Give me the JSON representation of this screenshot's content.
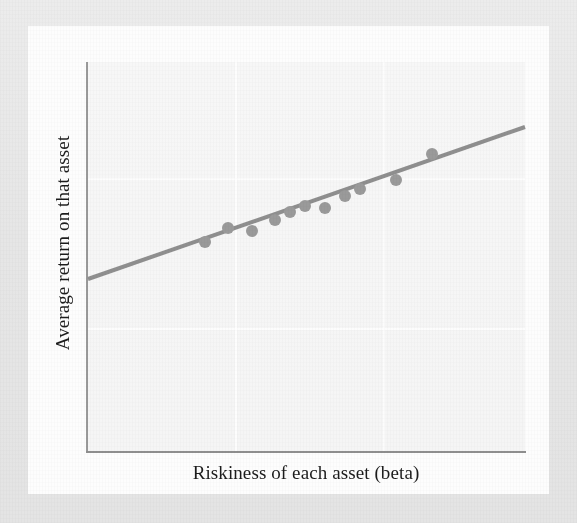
{
  "figure": {
    "kind": "scatter-with-fitted-line",
    "x_axis_label": "Riskiness of each asset (beta)",
    "y_axis_label": "Average return on that asset",
    "ghost_text": "faint reverse-side page bleed-through\nno legible text"
  },
  "colors": {
    "line": "#8f8f8f",
    "dot": "#9a9a9a",
    "axis": "#909090",
    "plot_background": "#f6f6f6",
    "paper": "#fdfdfd",
    "scan_border": "#e8e8e8",
    "text": "#1c1c1c"
  },
  "chart_data": {
    "type": "scatter",
    "title": "",
    "xlabel": "Riskiness of each asset (beta)",
    "ylabel": "Average return on that asset",
    "xlim": [
      0,
      1
    ],
    "ylim": [
      0,
      1
    ],
    "grid": false,
    "legend": null,
    "axis_tick_labels": {
      "x": [],
      "y": []
    },
    "series": [
      {
        "name": "Assets",
        "type": "scatter",
        "marker": "filled-circle",
        "marker_radius_px": 6,
        "color": "#9a9a9a",
        "points_px": [
          {
            "x": 205,
            "y": 242
          },
          {
            "x": 228,
            "y": 228
          },
          {
            "x": 252,
            "y": 231
          },
          {
            "x": 275,
            "y": 220
          },
          {
            "x": 290,
            "y": 212
          },
          {
            "x": 305,
            "y": 206
          },
          {
            "x": 325,
            "y": 208
          },
          {
            "x": 345,
            "y": 196
          },
          {
            "x": 360,
            "y": 189
          },
          {
            "x": 396,
            "y": 180
          },
          {
            "x": 432,
            "y": 154
          }
        ],
        "points_data": [
          {
            "x": 0.27,
            "y": 0.54
          },
          {
            "x": 0.32,
            "y": 0.57
          },
          {
            "x": 0.38,
            "y": 0.57
          },
          {
            "x": 0.43,
            "y": 0.59
          },
          {
            "x": 0.46,
            "y": 0.61
          },
          {
            "x": 0.5,
            "y": 0.63
          },
          {
            "x": 0.54,
            "y": 0.62
          },
          {
            "x": 0.59,
            "y": 0.65
          },
          {
            "x": 0.62,
            "y": 0.67
          },
          {
            "x": 0.71,
            "y": 0.7
          },
          {
            "x": 0.79,
            "y": 0.76
          }
        ]
      },
      {
        "name": "Fitted line",
        "type": "line",
        "color": "#8f8f8f",
        "width_px": 4,
        "endpoints_px": [
          {
            "x": 88,
            "y": 279
          },
          {
            "x": 525,
            "y": 127
          }
        ],
        "endpoints_data": [
          {
            "x": 0.0,
            "y": 0.445
          },
          {
            "x": 1.0,
            "y": 0.835
          }
        ]
      }
    ]
  }
}
